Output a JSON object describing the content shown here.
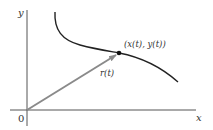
{
  "diagram": {
    "type": "parametric-curve-position-vector",
    "axes": {
      "x_label": "x",
      "y_label": "y",
      "origin_label": "0"
    },
    "point": {
      "label": "(x(t), y(t))"
    },
    "vector": {
      "label": "r(t)"
    },
    "colors": {
      "axis": "#555555",
      "curve": "#222222",
      "vector": "#8a8a8a",
      "point": "#111111",
      "text": "#333333",
      "background": "#ffffff"
    }
  }
}
